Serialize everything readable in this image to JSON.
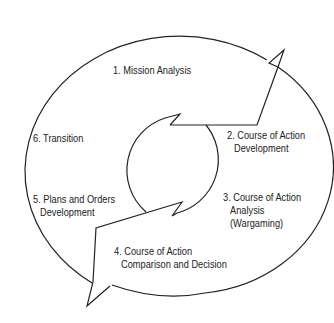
{
  "diagram": {
    "type": "cycle",
    "title": "",
    "colors": {
      "stroke": "#222222",
      "text": "#222222",
      "background": "#ffffff"
    },
    "steps": [
      {
        "number": "1.",
        "label": "1. Mission Analysis",
        "lines": [
          "1. Mission Analysis"
        ]
      },
      {
        "number": "2.",
        "label": "2. Course of Action Development",
        "lines": [
          "2. Course of Action",
          "Development"
        ]
      },
      {
        "number": "3.",
        "label": "3. Course of Action Analysis (Wargaming)",
        "lines": [
          "3. Course of Action",
          "Analysis",
          "(Wargaming)"
        ]
      },
      {
        "number": "4.",
        "label": "4. Course of Action Comparison and Decision",
        "lines": [
          "4. Course of Action",
          "Comparison and Decision"
        ]
      },
      {
        "number": "5.",
        "label": "5. Plans and Orders Development",
        "lines": [
          "5. Plans and Orders",
          "Development"
        ]
      },
      {
        "number": "6.",
        "label": "6. Transition",
        "lines": [
          "6. Transition"
        ]
      }
    ],
    "shapes": {
      "outer_cycle": "ellipse-with-two-arrows",
      "inner_cycle": "circle-with-two-arrows"
    }
  }
}
